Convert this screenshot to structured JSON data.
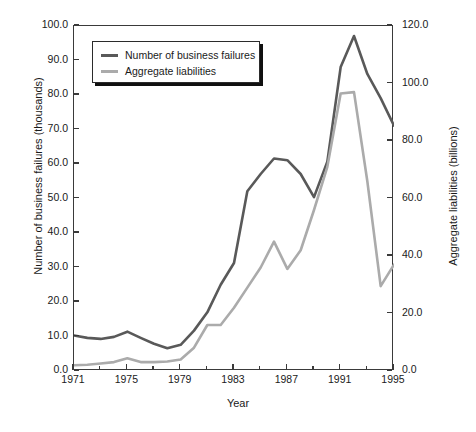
{
  "chart_data": {
    "type": "line",
    "title": "",
    "xlabel": "Year",
    "ylabel": "Number of business failures (thousands)",
    "y2label": "Aggregate liabilities (billions)",
    "xlim": [
      1971,
      1995
    ],
    "ylim": [
      0.0,
      100.0
    ],
    "y2lim": [
      0.0,
      120.0
    ],
    "grid": false,
    "legend_position": "top-left",
    "xticks": [
      "1971",
      "1975",
      "1979",
      "1983",
      "1987",
      "1991",
      "1995"
    ],
    "xtick_values": [
      1971,
      1975,
      1979,
      1983,
      1987,
      1991,
      1995
    ],
    "xminor_values": [
      1973,
      1977,
      1981,
      1985,
      1989,
      1993
    ],
    "yticks_left": [
      "0.0",
      "10.0",
      "20.0",
      "30.0",
      "40.0",
      "50.0",
      "60.0",
      "70.0",
      "80.0",
      "90.0",
      "100.0"
    ],
    "ytick_values_left": [
      0,
      10,
      20,
      30,
      40,
      50,
      60,
      70,
      80,
      90,
      100
    ],
    "yticks_right": [
      "0.0",
      "20.0",
      "40.0",
      "60.0",
      "80.0",
      "100.0",
      "120.0"
    ],
    "ytick_values_right": [
      0,
      20,
      40,
      60,
      80,
      100,
      120
    ],
    "x": [
      1971,
      1972,
      1973,
      1974,
      1975,
      1976,
      1977,
      1978,
      1979,
      1980,
      1981,
      1982,
      1983,
      1984,
      1985,
      1986,
      1987,
      1988,
      1989,
      1990,
      1991,
      1992,
      1993,
      1994,
      1995
    ],
    "series": [
      {
        "name": "Number of business failures",
        "axis": "left",
        "color": "#595959",
        "units": "thousands",
        "values": [
          10.3,
          9.6,
          9.3,
          9.9,
          11.4,
          9.6,
          7.9,
          6.6,
          7.6,
          11.7,
          17.0,
          25.0,
          31.3,
          52.1,
          57.1,
          61.6,
          61.1,
          57.1,
          50.4,
          60.7,
          88.1,
          97.1,
          86.1,
          79.1,
          71.1
        ]
      },
      {
        "name": "Aggregate liabilities",
        "axis": "right",
        "color": "#ababab",
        "units": "billions",
        "values": [
          2.0,
          2.2,
          2.6,
          3.1,
          4.4,
          3.1,
          3.1,
          3.3,
          4.0,
          8.1,
          16.0,
          16.0,
          22.0,
          29.0,
          36.0,
          45.0,
          35.5,
          42.0,
          56.0,
          71.0,
          96.5,
          97.0,
          66.0,
          29.5,
          37.0
        ]
      }
    ],
    "series_left_in_left_units": [
      10.3,
      9.6,
      9.3,
      9.9,
      11.4,
      9.6,
      7.9,
      6.6,
      7.6,
      11.7,
      17.0,
      25.0,
      31.3,
      52.1,
      57.1,
      61.6,
      61.1,
      57.1,
      50.4,
      60.7,
      88.1,
      97.1,
      86.1,
      79.1,
      71.1
    ],
    "series_right_in_left_units": [
      1.7,
      1.8,
      2.2,
      2.6,
      3.7,
      2.6,
      2.6,
      2.8,
      3.3,
      6.8,
      13.3,
      13.3,
      18.3,
      24.2,
      30.0,
      37.5,
      29.6,
      35.0,
      46.7,
      59.2,
      80.4,
      80.8,
      55.0,
      24.6,
      30.8
    ]
  },
  "axes": {
    "x_title": "Year",
    "y_left_title": "Number of business failures (thousands)",
    "y_right_title": "Aggregate liabilities (billions)"
  },
  "legend": {
    "items": [
      {
        "label": "Number of business failures",
        "color": "#595959"
      },
      {
        "label": "Aggregate liabilities",
        "color": "#ababab"
      }
    ]
  }
}
